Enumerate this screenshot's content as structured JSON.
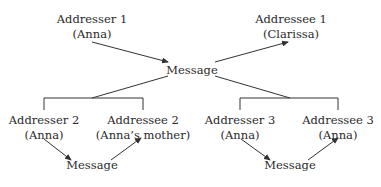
{
  "diagram": {
    "top": {
      "addresser": {
        "role": "Addresser 1",
        "person": "(Anna)"
      },
      "message": "Message",
      "addressee": {
        "role": "Addressee 1",
        "person": "(Clarissa)"
      }
    },
    "left": {
      "addresser": {
        "role": "Addresser 2",
        "person": "(Anna)"
      },
      "message": "Message",
      "addressee": {
        "role": "Addressee 2",
        "person": "(Anna’s mother)"
      }
    },
    "right": {
      "addresser": {
        "role": "Addresser 3",
        "person": "(Anna)"
      },
      "message": "Message",
      "addressee": {
        "role": "Addressee 3",
        "person": "(Anna)"
      }
    },
    "colors": {
      "line": "#333333",
      "text": "#2a2a2a"
    }
  }
}
